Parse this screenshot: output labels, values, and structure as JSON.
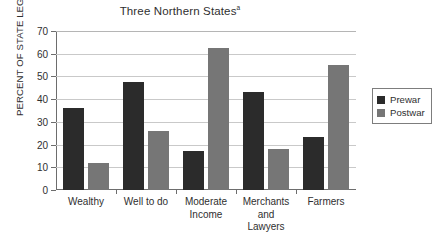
{
  "chart_data": {
    "type": "bar",
    "title": "Three Northern States",
    "title_superscript": "a",
    "xlabel": "",
    "ylabel": "PERCENT OF STATE LEGISLATORS",
    "ylim": [
      0,
      70
    ],
    "yticks": [
      0,
      10,
      20,
      30,
      40,
      50,
      60,
      70
    ],
    "ytick_labels": [
      "0",
      "10",
      "20",
      "30",
      "40",
      "50",
      "60",
      "70"
    ],
    "grid": true,
    "legend_position": "right",
    "categories": [
      "Wealthy",
      "Well to do",
      "Moderate Income",
      "Merchants and Lawyers",
      "Farmers"
    ],
    "category_label_lines": [
      [
        "Wealthy"
      ],
      [
        "Well to do"
      ],
      [
        "Moderate",
        "Income"
      ],
      [
        "Merchants",
        "and",
        "Lawyers"
      ],
      [
        "Farmers"
      ]
    ],
    "series": [
      {
        "name": "Prewar",
        "color": "#2b2b2b",
        "values": [
          36,
          47.5,
          17,
          43,
          23.5
        ]
      },
      {
        "name": "Postwar",
        "color": "#767676",
        "values": [
          12,
          26,
          62.5,
          18,
          55
        ]
      }
    ]
  },
  "legend": {
    "items": [
      {
        "label": "Prewar",
        "color": "#2b2b2b"
      },
      {
        "label": "Postwar",
        "color": "#767676"
      }
    ]
  }
}
